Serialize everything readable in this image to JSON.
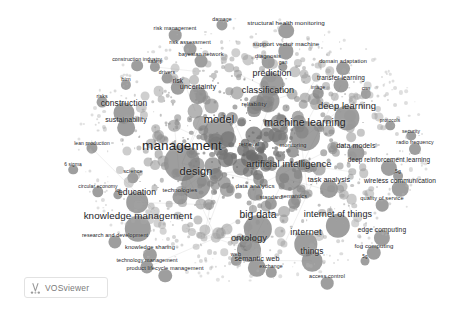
{
  "app": {
    "name": "VOSviewer",
    "watermark_label": "VOSviewer",
    "watermark_icon": "vosviewer-logo-icon"
  },
  "canvas": {
    "width": 468,
    "height": 318,
    "background_color": "#ffffff",
    "node_color": "#8a8a8a",
    "label_color": "#23231f",
    "link_color": "#c9c9c9",
    "rendering": "grayscale-network-visualization"
  },
  "chart_data": {
    "type": "scatter",
    "title": "",
    "xlabel": "",
    "ylabel": "",
    "grid": false,
    "legend": "none",
    "xlim": [
      0,
      468
    ],
    "ylim": [
      0,
      318
    ],
    "terms": [
      {
        "label": "management",
        "x": 182,
        "y": 146,
        "size": 13.5,
        "weight": 100
      },
      {
        "label": "model",
        "x": 219,
        "y": 119,
        "size": 11.0,
        "weight": 84
      },
      {
        "label": "machine learning",
        "x": 305,
        "y": 122,
        "size": 10.5,
        "weight": 80
      },
      {
        "label": "design",
        "x": 196,
        "y": 171,
        "size": 11.0,
        "weight": 78
      },
      {
        "label": "big data",
        "x": 258,
        "y": 215,
        "size": 10.2,
        "weight": 74
      },
      {
        "label": "artificial intelligence",
        "x": 289,
        "y": 164,
        "size": 9.6,
        "weight": 70
      },
      {
        "label": "knowledge management",
        "x": 138,
        "y": 216,
        "size": 9.8,
        "weight": 68
      },
      {
        "label": "deep learning",
        "x": 347,
        "y": 106,
        "size": 9.4,
        "weight": 64
      },
      {
        "label": "internet of things",
        "x": 338,
        "y": 214,
        "size": 9.0,
        "weight": 61
      },
      {
        "label": "ontology",
        "x": 249,
        "y": 238,
        "size": 9.4,
        "weight": 60
      },
      {
        "label": "internet",
        "x": 306,
        "y": 233,
        "size": 9.2,
        "weight": 58
      },
      {
        "label": "classification",
        "x": 268,
        "y": 90,
        "size": 9.0,
        "weight": 57
      },
      {
        "label": "prediction",
        "x": 272,
        "y": 73,
        "size": 8.8,
        "weight": 55
      },
      {
        "label": "education",
        "x": 137,
        "y": 192,
        "size": 8.6,
        "weight": 52
      },
      {
        "label": "construction",
        "x": 124,
        "y": 103,
        "size": 8.4,
        "weight": 50
      },
      {
        "label": "things",
        "x": 312,
        "y": 251,
        "size": 8.4,
        "weight": 49
      },
      {
        "label": "semantic web",
        "x": 257,
        "y": 259,
        "size": 7.2,
        "weight": 41
      },
      {
        "label": "task analysis",
        "x": 329,
        "y": 180,
        "size": 7.2,
        "weight": 40
      },
      {
        "label": "sustainability",
        "x": 126,
        "y": 119,
        "size": 7.0,
        "weight": 39
      },
      {
        "label": "uncertainty",
        "x": 198,
        "y": 87,
        "size": 7.2,
        "weight": 38
      },
      {
        "label": "data models",
        "x": 356,
        "y": 145,
        "size": 7.0,
        "weight": 37
      },
      {
        "label": "wireless communication",
        "x": 400,
        "y": 181,
        "size": 6.6,
        "weight": 35
      },
      {
        "label": "deep reinforcement learning",
        "x": 389,
        "y": 160,
        "size": 6.4,
        "weight": 34
      },
      {
        "label": "edge computing",
        "x": 382,
        "y": 230,
        "size": 6.6,
        "weight": 34
      },
      {
        "label": "structural health monitoring",
        "x": 286,
        "y": 23,
        "size": 6.2,
        "weight": 32
      },
      {
        "label": "support vector machine",
        "x": 286,
        "y": 44,
        "size": 6.2,
        "weight": 31
      },
      {
        "label": "technologies",
        "x": 180,
        "y": 190,
        "size": 6.0,
        "weight": 30
      },
      {
        "label": "transfer learning",
        "x": 341,
        "y": 78,
        "size": 6.4,
        "weight": 30
      },
      {
        "label": "data analytics",
        "x": 255,
        "y": 186,
        "size": 6.2,
        "weight": 29
      },
      {
        "label": "fog computing",
        "x": 374,
        "y": 246,
        "size": 6.0,
        "weight": 28
      },
      {
        "label": "risk",
        "x": 178,
        "y": 81,
        "size": 6.4,
        "weight": 28
      },
      {
        "label": "knowledge sharing",
        "x": 150,
        "y": 248,
        "size": 5.8,
        "weight": 27
      },
      {
        "label": "domain adaptation",
        "x": 343,
        "y": 62,
        "size": 5.6,
        "weight": 26
      },
      {
        "label": "reliability",
        "x": 254,
        "y": 104,
        "size": 6.2,
        "weight": 26
      },
      {
        "label": "product lifecycle management",
        "x": 165,
        "y": 269,
        "size": 5.6,
        "weight": 25
      },
      {
        "label": "technology management",
        "x": 147,
        "y": 261,
        "size": 5.4,
        "weight": 24
      },
      {
        "label": "research and development",
        "x": 115,
        "y": 236,
        "size": 5.4,
        "weight": 24
      },
      {
        "label": "bayesian network",
        "x": 201,
        "y": 55,
        "size": 5.6,
        "weight": 23
      },
      {
        "label": "risk assessment",
        "x": 190,
        "y": 43,
        "size": 5.6,
        "weight": 23
      },
      {
        "label": "risk management",
        "x": 175,
        "y": 29,
        "size": 5.4,
        "weight": 22
      },
      {
        "label": "access control",
        "x": 327,
        "y": 277,
        "size": 5.4,
        "weight": 22
      },
      {
        "label": "quality of service",
        "x": 382,
        "y": 199,
        "size": 5.6,
        "weight": 22
      },
      {
        "label": "diagnosis",
        "x": 268,
        "y": 56,
        "size": 6.0,
        "weight": 22
      },
      {
        "label": "monitoring",
        "x": 293,
        "y": 146,
        "size": 5.6,
        "weight": 21
      },
      {
        "label": "standard",
        "x": 271,
        "y": 198,
        "size": 5.6,
        "weight": 21
      },
      {
        "label": "semantics",
        "x": 294,
        "y": 197,
        "size": 5.6,
        "weight": 20
      },
      {
        "label": "radio frequency",
        "x": 415,
        "y": 143,
        "size": 5.2,
        "weight": 20
      },
      {
        "label": "platform",
        "x": 246,
        "y": 239,
        "size": 5.6,
        "weight": 20
      },
      {
        "label": "retrieval",
        "x": 249,
        "y": 145,
        "size": 5.4,
        "weight": 19
      },
      {
        "label": "construction industry",
        "x": 137,
        "y": 60,
        "size": 5.2,
        "weight": 19
      },
      {
        "label": "science",
        "x": 133,
        "y": 172,
        "size": 5.6,
        "weight": 18
      },
      {
        "label": "circular economy",
        "x": 98,
        "y": 186,
        "size": 5.0,
        "weight": 18
      },
      {
        "label": "lean production",
        "x": 92,
        "y": 143,
        "size": 5.0,
        "weight": 17
      },
      {
        "label": "damage",
        "x": 222,
        "y": 20,
        "size": 5.2,
        "weight": 17
      },
      {
        "label": "drivers",
        "x": 167,
        "y": 73,
        "size": 5.2,
        "weight": 16
      },
      {
        "label": "risks",
        "x": 102,
        "y": 97,
        "size": 5.2,
        "weight": 16
      },
      {
        "label": "exchange",
        "x": 271,
        "y": 267,
        "size": 5.2,
        "weight": 15
      },
      {
        "label": "web",
        "x": 236,
        "y": 255,
        "size": 5.6,
        "weight": 15
      },
      {
        "label": "image",
        "x": 318,
        "y": 88,
        "size": 5.2,
        "weight": 15
      },
      {
        "label": "cnn",
        "x": 366,
        "y": 89,
        "size": 5.2,
        "weight": 14
      },
      {
        "label": "bim",
        "x": 126,
        "y": 80,
        "size": 5.6,
        "weight": 14
      },
      {
        "label": "safety",
        "x": 155,
        "y": 62,
        "size": 5.2,
        "weight": 14
      },
      {
        "label": "5g",
        "x": 398,
        "y": 171,
        "size": 5.0,
        "weight": 13
      },
      {
        "label": "6 sigma",
        "x": 73,
        "y": 165,
        "size": 4.8,
        "weight": 12
      },
      {
        "label": "security",
        "x": 411,
        "y": 131,
        "size": 5.0,
        "weight": 12
      },
      {
        "label": "protocols",
        "x": 390,
        "y": 121,
        "size": 4.8,
        "weight": 12
      },
      {
        "label": "gan",
        "x": 283,
        "y": 62,
        "size": 5.0,
        "weight": 11
      },
      {
        "label": "iot",
        "x": 118,
        "y": 190,
        "size": 5.0,
        "weight": 11
      },
      {
        "label": "5g",
        "x": 365,
        "y": 257,
        "size": 4.6,
        "weight": 10
      }
    ]
  }
}
